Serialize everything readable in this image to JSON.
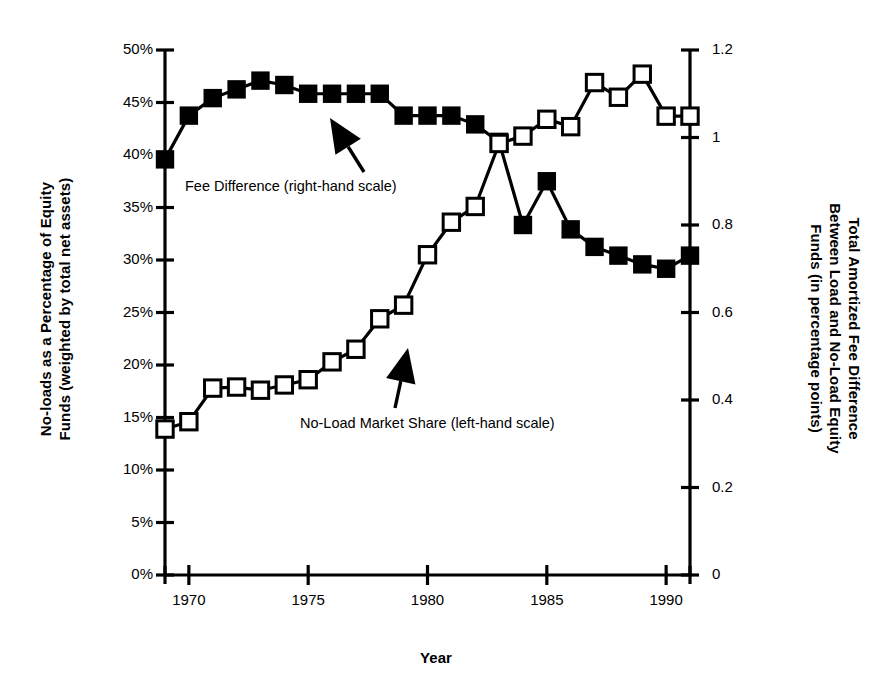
{
  "chart_data": {
    "type": "line",
    "title": "",
    "xlabel": "Year",
    "ylabel": "No-loads as a Percentage of Equity Funds (weighted by total net assets)",
    "ylabel_right": "Total Amortized Fee Difference Between Load and No-Load Equity Funds (in percentage points)",
    "ylabel_left_lines": [
      "No-loads as a Percentage of Equity",
      "Funds (weighted by total net assets)"
    ],
    "ylabel_right_lines": [
      "Total Amortized Fee Difference",
      "Between Load and No-Load Equity",
      "Funds (in percentage points)"
    ],
    "xlim": [
      1969,
      1991
    ],
    "ylim": [
      0,
      50
    ],
    "ylim_right": [
      0,
      1.2
    ],
    "grid": false,
    "legend_position": "inline-annotations",
    "x_tick_labels": [
      "1970",
      "1975",
      "1980",
      "1985",
      "1990"
    ],
    "x_tick_values": [
      1970,
      1975,
      1980,
      1985,
      1990
    ],
    "x_minor_ticks": [
      1969,
      1970,
      1971,
      1972,
      1973,
      1974,
      1975,
      1976,
      1977,
      1978,
      1979,
      1980,
      1981,
      1982,
      1983,
      1984,
      1985,
      1986,
      1987,
      1988,
      1989,
      1990,
      1991
    ],
    "y_tick_labels_left": [
      "0%",
      "5%",
      "10%",
      "15%",
      "20%",
      "25%",
      "30%",
      "35%",
      "40%",
      "45%",
      "50%"
    ],
    "y_tick_values_left": [
      0,
      5,
      10,
      15,
      20,
      25,
      30,
      35,
      40,
      45,
      50
    ],
    "y_tick_labels_right": [
      "0",
      "0.2",
      "0.4",
      "0.6",
      "0.8",
      "1",
      "1.2"
    ],
    "y_tick_values_right": [
      0,
      0.2,
      0.4,
      0.6,
      0.8,
      1.0,
      1.2
    ],
    "x": [
      1969,
      1970,
      1971,
      1972,
      1973,
      1974,
      1975,
      1976,
      1977,
      1978,
      1979,
      1980,
      1981,
      1982,
      1983,
      1984,
      1985,
      1986,
      1987,
      1988,
      1989,
      1990,
      1991
    ],
    "series": [
      {
        "name": "Fee Difference (right-hand scale)",
        "axis": "right",
        "marker": "filled-square",
        "units": "percentage points",
        "values": [
          0.95,
          1.05,
          1.09,
          1.11,
          1.13,
          1.12,
          1.1,
          1.1,
          1.1,
          1.1,
          1.05,
          1.05,
          1.05,
          1.03,
          0.99,
          0.8,
          0.9,
          0.79,
          0.75,
          0.73,
          0.71,
          0.7,
          0.73
        ]
      },
      {
        "name": "No-Load Market Share (left-hand scale)",
        "axis": "left",
        "marker": "open-square",
        "units": "percent",
        "values": [
          13.9,
          14.6,
          17.8,
          17.9,
          17.6,
          18.1,
          18.6,
          20.3,
          21.5,
          24.4,
          25.7,
          30.5,
          33.6,
          35.1,
          41.1,
          41.8,
          43.4,
          42.7,
          46.9,
          45.5,
          47.7,
          43.7,
          43.7
        ]
      }
    ],
    "annotations": [
      {
        "text": "Fee Difference (right-hand scale)",
        "points_to_series": "Fee Difference (right-hand scale)"
      },
      {
        "text": "No-Load Market Share (left-hand scale)",
        "points_to_series": "No-Load Market Share (left-hand scale)"
      }
    ],
    "colors": {
      "line": "#000000",
      "marker_filled": "#000000",
      "marker_open_fill": "#ffffff",
      "axis": "#000000",
      "background": "#ffffff"
    }
  }
}
